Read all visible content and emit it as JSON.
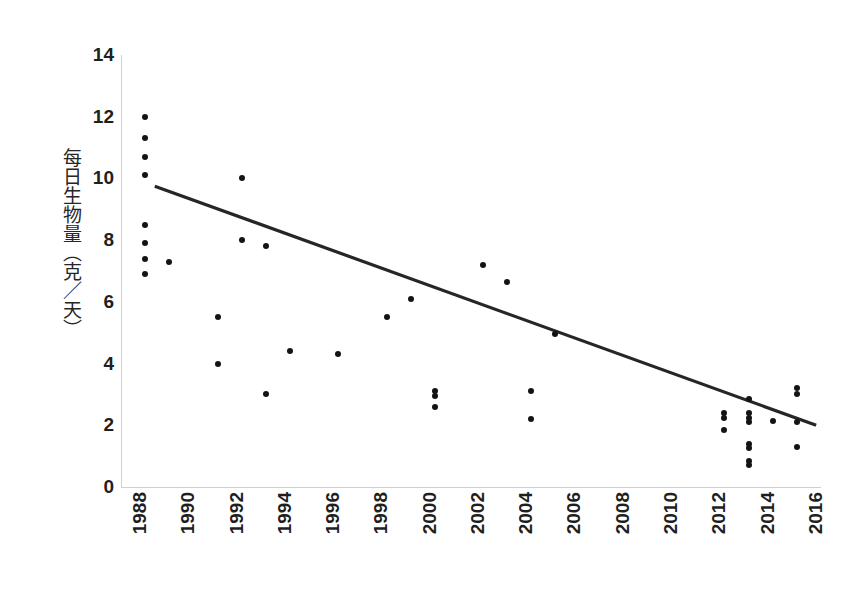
{
  "chart_data": {
    "type": "scatter",
    "title": "",
    "xlabel": "",
    "ylabel": "每日生物量（克／天）",
    "xlim": [
      1988,
      2017
    ],
    "ylim": [
      0,
      14
    ],
    "grid": false,
    "legend": null,
    "x_ticks": [
      "1988",
      "1990",
      "1992",
      "1994",
      "1996",
      "1998",
      "2000",
      "2002",
      "2004",
      "2006",
      "2008",
      "2010",
      "2012",
      "2014",
      "2016"
    ],
    "x_tick_values": [
      1988,
      1990,
      1992,
      1994,
      1996,
      1998,
      2000,
      2002,
      2004,
      2006,
      2008,
      2010,
      2012,
      2014,
      2016
    ],
    "y_ticks": [
      "0",
      "2",
      "4",
      "6",
      "8",
      "10",
      "12",
      "14"
    ],
    "y_tick_values": [
      0,
      2,
      4,
      6,
      8,
      10,
      12,
      14
    ],
    "point_color": "#141414",
    "trendline_color": "#262626",
    "points": [
      {
        "x": 1989,
        "y": 12.0
      },
      {
        "x": 1989,
        "y": 11.3
      },
      {
        "x": 1989,
        "y": 10.7
      },
      {
        "x": 1989,
        "y": 10.1
      },
      {
        "x": 1989,
        "y": 8.5
      },
      {
        "x": 1989,
        "y": 7.9
      },
      {
        "x": 1989,
        "y": 7.4
      },
      {
        "x": 1989,
        "y": 6.9
      },
      {
        "x": 1990,
        "y": 7.3
      },
      {
        "x": 1992,
        "y": 5.5
      },
      {
        "x": 1992,
        "y": 4.0
      },
      {
        "x": 1993,
        "y": 10.0
      },
      {
        "x": 1993,
        "y": 8.0
      },
      {
        "x": 1994,
        "y": 7.8
      },
      {
        "x": 1994,
        "y": 3.0
      },
      {
        "x": 1995,
        "y": 4.4
      },
      {
        "x": 1997,
        "y": 4.3
      },
      {
        "x": 1999,
        "y": 5.5
      },
      {
        "x": 2000,
        "y": 6.1
      },
      {
        "x": 2001,
        "y": 3.1
      },
      {
        "x": 2001,
        "y": 2.95
      },
      {
        "x": 2001,
        "y": 2.6
      },
      {
        "x": 2003,
        "y": 7.2
      },
      {
        "x": 2004,
        "y": 6.65
      },
      {
        "x": 2005,
        "y": 3.1
      },
      {
        "x": 2005,
        "y": 2.2
      },
      {
        "x": 2006,
        "y": 4.95
      },
      {
        "x": 2013,
        "y": 2.4
      },
      {
        "x": 2013,
        "y": 2.25
      },
      {
        "x": 2013,
        "y": 1.85
      },
      {
        "x": 2014,
        "y": 2.85
      },
      {
        "x": 2014,
        "y": 2.4
      },
      {
        "x": 2014,
        "y": 2.25
      },
      {
        "x": 2014,
        "y": 2.1
      },
      {
        "x": 2014,
        "y": 1.4
      },
      {
        "x": 2014,
        "y": 1.25
      },
      {
        "x": 2014,
        "y": 0.85
      },
      {
        "x": 2014,
        "y": 0.7
      },
      {
        "x": 2015,
        "y": 2.15
      },
      {
        "x": 2016,
        "y": 3.2
      },
      {
        "x": 2016,
        "y": 3.0
      },
      {
        "x": 2016,
        "y": 2.1
      },
      {
        "x": 2016,
        "y": 1.3
      }
    ],
    "trendline": {
      "x_start": 1989.4,
      "y_start": 9.75,
      "x_end": 2016.8,
      "y_end": 2.0
    }
  }
}
